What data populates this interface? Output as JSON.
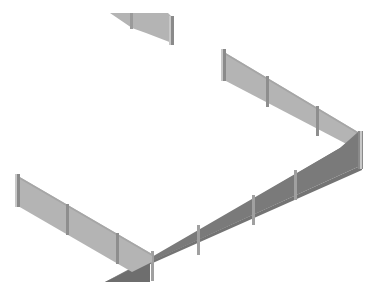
{
  "scene": {
    "description": "Isometric 3D rendering of fence wall panels with posts",
    "colors": {
      "background": "#ffffff",
      "panel_light": "#b4b4b4",
      "panel_dark": "#7c7c7c",
      "post_light": "#d2d2d2",
      "post_dark": "#8a8a8a",
      "edge": "#9a9a9a"
    },
    "segments": [
      {
        "name": "top-fragment",
        "posts": 2
      },
      {
        "name": "back-right-wall",
        "posts": 4
      },
      {
        "name": "front-right-wall",
        "posts": 5
      },
      {
        "name": "left-wall",
        "posts": 3
      }
    ]
  }
}
